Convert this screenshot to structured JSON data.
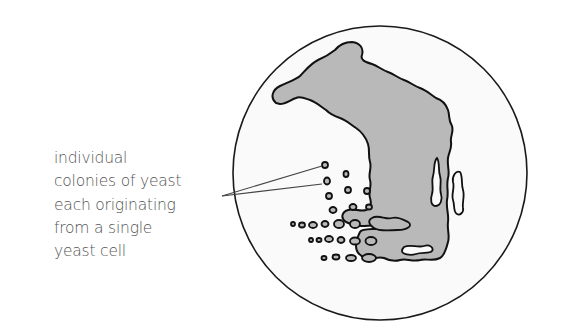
{
  "diagram": {
    "label_lines": [
      "individual",
      "colonies of yeast",
      "each originating",
      "from a single",
      "yeast cell"
    ],
    "colors": {
      "plate_fill": "#fafafa",
      "plate_outline": "#1a1a1a",
      "growth_fill": "#b9b9b9",
      "growth_outline": "#111111",
      "label_text": "#555555",
      "leader_line": "#444444"
    }
  }
}
